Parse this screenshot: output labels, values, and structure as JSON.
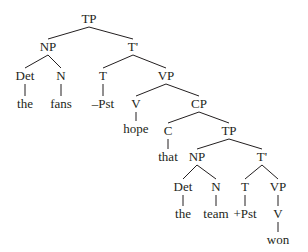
{
  "diagram": {
    "type": "syntax-tree",
    "nodes": [
      {
        "id": "n0",
        "label": "TP",
        "x": 89,
        "y": 12
      },
      {
        "id": "n1",
        "label": "NP",
        "x": 48,
        "y": 40
      },
      {
        "id": "n2",
        "label": "T'",
        "x": 133,
        "y": 40
      },
      {
        "id": "n3",
        "label": "Det",
        "x": 25,
        "y": 69
      },
      {
        "id": "n4",
        "label": "N",
        "x": 61,
        "y": 69
      },
      {
        "id": "n5",
        "label": "the",
        "x": 25,
        "y": 97
      },
      {
        "id": "n6",
        "label": "fans",
        "x": 61,
        "y": 97
      },
      {
        "id": "n7",
        "label": "T",
        "x": 103,
        "y": 69
      },
      {
        "id": "n8",
        "label": "VP",
        "x": 166,
        "y": 69
      },
      {
        "id": "n9",
        "label": "–Pst",
        "x": 103,
        "y": 97
      },
      {
        "id": "n10",
        "label": "V",
        "x": 136,
        "y": 97
      },
      {
        "id": "n11",
        "label": "CP",
        "x": 199,
        "y": 97
      },
      {
        "id": "n12",
        "label": "hope",
        "x": 136,
        "y": 122
      },
      {
        "id": "n13",
        "label": "C",
        "x": 168,
        "y": 124
      },
      {
        "id": "n14",
        "label": "TP",
        "x": 229,
        "y": 124
      },
      {
        "id": "n15",
        "label": "that",
        "x": 168,
        "y": 150
      },
      {
        "id": "n16",
        "label": "NP",
        "x": 197,
        "y": 150
      },
      {
        "id": "n17",
        "label": "T'",
        "x": 262,
        "y": 150
      },
      {
        "id": "n18",
        "label": "Det",
        "x": 183,
        "y": 180
      },
      {
        "id": "n19",
        "label": "N",
        "x": 216,
        "y": 180
      },
      {
        "id": "n20",
        "label": "T",
        "x": 245,
        "y": 180
      },
      {
        "id": "n21",
        "label": "VP",
        "x": 278,
        "y": 180
      },
      {
        "id": "n22",
        "label": "the",
        "x": 183,
        "y": 207
      },
      {
        "id": "n23",
        "label": "team",
        "x": 216,
        "y": 207
      },
      {
        "id": "n24",
        "label": "+Pst",
        "x": 245,
        "y": 207
      },
      {
        "id": "n25",
        "label": "V",
        "x": 278,
        "y": 207
      },
      {
        "id": "n26",
        "label": "won",
        "x": 278,
        "y": 233
      }
    ],
    "edges": [
      [
        "n0",
        "n1"
      ],
      [
        "n0",
        "n2"
      ],
      [
        "n1",
        "n3"
      ],
      [
        "n1",
        "n4"
      ],
      [
        "n3",
        "n5"
      ],
      [
        "n4",
        "n6"
      ],
      [
        "n2",
        "n7"
      ],
      [
        "n2",
        "n8"
      ],
      [
        "n7",
        "n9"
      ],
      [
        "n8",
        "n10"
      ],
      [
        "n8",
        "n11"
      ],
      [
        "n10",
        "n12"
      ],
      [
        "n11",
        "n13"
      ],
      [
        "n11",
        "n14"
      ],
      [
        "n13",
        "n15"
      ],
      [
        "n14",
        "n16"
      ],
      [
        "n14",
        "n17"
      ],
      [
        "n16",
        "n18"
      ],
      [
        "n16",
        "n19"
      ],
      [
        "n18",
        "n22"
      ],
      [
        "n19",
        "n23"
      ],
      [
        "n17",
        "n20"
      ],
      [
        "n17",
        "n21"
      ],
      [
        "n20",
        "n24"
      ],
      [
        "n21",
        "n25"
      ],
      [
        "n25",
        "n26"
      ]
    ],
    "colors": {
      "ink": "#231f20",
      "background": "#ffffff"
    }
  }
}
